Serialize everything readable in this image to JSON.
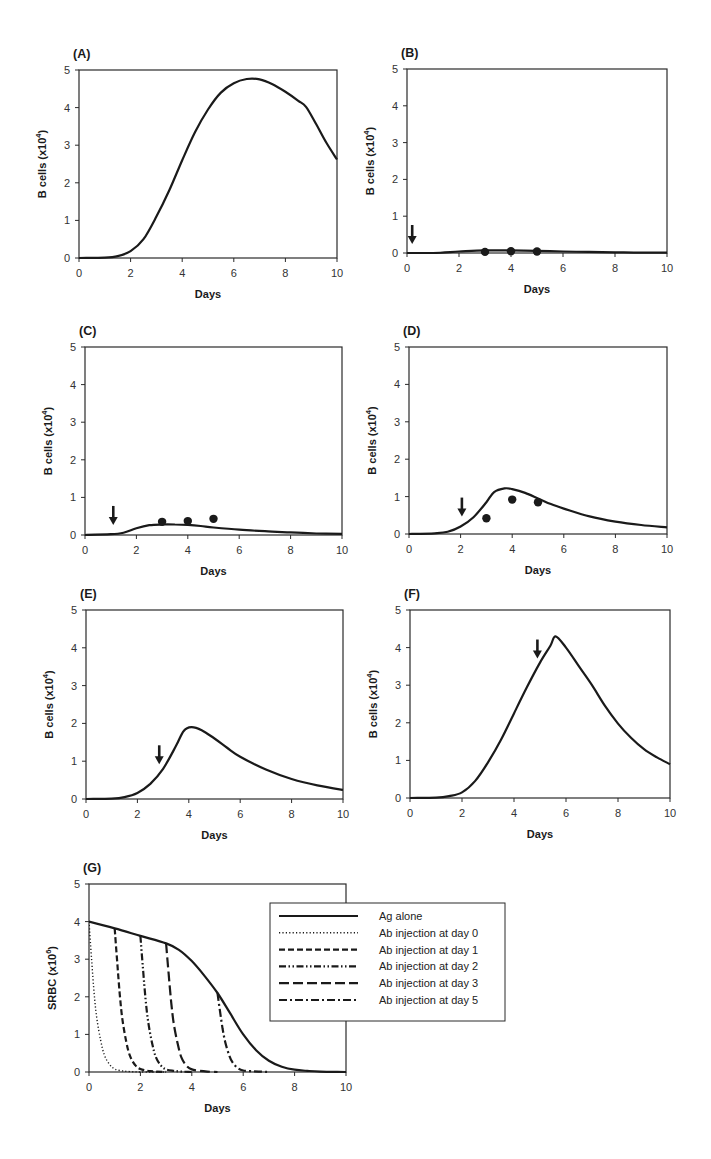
{
  "figure": {
    "width": 711,
    "height": 1159,
    "colors": {
      "ink": "#1a1a1a",
      "axis": "#2a2a2a",
      "background": "#ffffff"
    }
  },
  "chart_data": [
    {
      "id": "A",
      "type": "line",
      "panel_label": "(A)",
      "xlabel": "Days",
      "ylabel": "B cells  (x10",
      "ylabel_sup": "4",
      "ylabel_close": ")",
      "xlim": [
        0,
        10
      ],
      "ylim": [
        0,
        5
      ],
      "xticks": [
        0,
        2,
        4,
        6,
        8,
        10
      ],
      "yticks": [
        0,
        1,
        2,
        3,
        4,
        5
      ],
      "grid": false,
      "arrow_day": null,
      "series": [
        {
          "name": "B cells (model)",
          "style": "solid",
          "x": [
            0,
            1,
            1.5,
            2,
            2.5,
            3,
            3.5,
            4,
            4.5,
            5,
            5.5,
            6,
            6.5,
            7,
            7.5,
            8,
            8.5,
            8.8,
            9.2,
            9.6,
            10
          ],
          "y": [
            0,
            0.01,
            0.05,
            0.18,
            0.5,
            1.1,
            1.8,
            2.6,
            3.35,
            3.95,
            4.4,
            4.65,
            4.76,
            4.75,
            4.62,
            4.42,
            4.18,
            4.02,
            3.55,
            3.05,
            2.62
          ]
        }
      ],
      "points": [],
      "bbox": {
        "left": 79,
        "top": 70,
        "right": 337,
        "bottom": 258
      }
    },
    {
      "id": "B",
      "type": "line",
      "panel_label": "(B)",
      "xlabel": "Days",
      "ylabel": "B cells  (x10",
      "ylabel_sup": "4",
      "ylabel_close": ")",
      "xlim": [
        0,
        10
      ],
      "ylim": [
        0,
        5
      ],
      "xticks": [
        0,
        2,
        4,
        6,
        8,
        10
      ],
      "yticks": [
        0,
        1,
        2,
        3,
        4,
        5
      ],
      "grid": false,
      "arrow_day": 0.2,
      "series": [
        {
          "name": "B cells (model)",
          "style": "solid",
          "x": [
            0,
            1,
            2,
            3,
            4,
            5,
            6,
            7,
            8,
            9,
            10
          ],
          "y": [
            0,
            0,
            0.04,
            0.07,
            0.07,
            0.06,
            0.04,
            0.03,
            0.02,
            0.01,
            0.01
          ]
        }
      ],
      "points": [
        {
          "x": 3,
          "y": 0.03
        },
        {
          "x": 4,
          "y": 0.05
        },
        {
          "x": 5,
          "y": 0.04
        }
      ],
      "bbox": {
        "left": 407,
        "top": 69,
        "right": 667,
        "bottom": 253
      }
    },
    {
      "id": "C",
      "type": "line",
      "panel_label": "(C)",
      "xlabel": "Days",
      "ylabel": "B cells  (x10",
      "ylabel_sup": "4",
      "ylabel_close": ")",
      "xlim": [
        0,
        10
      ],
      "ylim": [
        0,
        5
      ],
      "xticks": [
        0,
        2,
        4,
        6,
        8,
        10
      ],
      "yticks": [
        0,
        1,
        2,
        3,
        4,
        5
      ],
      "grid": false,
      "arrow_day": 1.1,
      "series": [
        {
          "name": "B cells (model)",
          "style": "solid",
          "x": [
            0,
            1,
            1.5,
            2,
            2.5,
            3,
            3.5,
            4,
            4.5,
            5,
            6,
            7,
            8,
            9,
            10
          ],
          "y": [
            0,
            0.02,
            0.06,
            0.18,
            0.26,
            0.28,
            0.28,
            0.27,
            0.24,
            0.2,
            0.14,
            0.1,
            0.07,
            0.04,
            0.03
          ]
        }
      ],
      "points": [
        {
          "x": 3,
          "y": 0.35
        },
        {
          "x": 4,
          "y": 0.37
        },
        {
          "x": 5,
          "y": 0.43
        }
      ],
      "bbox": {
        "left": 85,
        "top": 347,
        "right": 342,
        "bottom": 535
      }
    },
    {
      "id": "D",
      "type": "line",
      "panel_label": "(D)",
      "xlabel": "Days",
      "ylabel": "B cells  (x10",
      "ylabel_sup": "4",
      "ylabel_close": ")",
      "xlim": [
        0,
        10
      ],
      "ylim": [
        0,
        5
      ],
      "xticks": [
        0,
        2,
        4,
        6,
        8,
        10
      ],
      "yticks": [
        0,
        1,
        2,
        3,
        4,
        5
      ],
      "grid": false,
      "arrow_day": 2.05,
      "series": [
        {
          "name": "B cells (model)",
          "style": "solid",
          "x": [
            0,
            1,
            1.5,
            2,
            2.5,
            3,
            3.3,
            3.7,
            4,
            4.5,
            5,
            5.5,
            6,
            7,
            8,
            9,
            10
          ],
          "y": [
            0,
            0.02,
            0.06,
            0.2,
            0.45,
            0.85,
            1.12,
            1.22,
            1.2,
            1.1,
            0.95,
            0.8,
            0.68,
            0.47,
            0.33,
            0.24,
            0.18
          ]
        }
      ],
      "points": [
        {
          "x": 3,
          "y": 0.42
        },
        {
          "x": 4,
          "y": 0.92
        },
        {
          "x": 5,
          "y": 0.85
        }
      ],
      "bbox": {
        "left": 409,
        "top": 347,
        "right": 667,
        "bottom": 534
      }
    },
    {
      "id": "E",
      "type": "line",
      "panel_label": "(E)",
      "xlabel": "Days",
      "ylabel": "B cells  (x10",
      "ylabel_sup": "4",
      "ylabel_close": ")",
      "xlim": [
        0,
        10
      ],
      "ylim": [
        0,
        5
      ],
      "xticks": [
        0,
        2,
        4,
        6,
        8,
        10
      ],
      "yticks": [
        0,
        1,
        2,
        3,
        4,
        5
      ],
      "grid": false,
      "arrow_day": 2.85,
      "series": [
        {
          "name": "B cells (model)",
          "style": "solid",
          "x": [
            0,
            1,
            1.5,
            2,
            2.5,
            3,
            3.5,
            3.8,
            4.1,
            4.5,
            5,
            5.5,
            6,
            7,
            8,
            9,
            10
          ],
          "y": [
            0,
            0.01,
            0.05,
            0.16,
            0.4,
            0.8,
            1.4,
            1.8,
            1.9,
            1.82,
            1.6,
            1.35,
            1.12,
            0.78,
            0.53,
            0.36,
            0.24
          ]
        }
      ],
      "points": [],
      "bbox": {
        "left": 86,
        "top": 610,
        "right": 343,
        "bottom": 799
      }
    },
    {
      "id": "F",
      "type": "line",
      "panel_label": "(F)",
      "xlabel": "Days",
      "ylabel": "B cells  (x10",
      "ylabel_sup": "4",
      "ylabel_close": ")",
      "xlim": [
        0,
        10
      ],
      "ylim": [
        0,
        5
      ],
      "xticks": [
        0,
        2,
        4,
        6,
        8,
        10
      ],
      "yticks": [
        0,
        1,
        2,
        3,
        4,
        5
      ],
      "grid": false,
      "arrow_day": 4.9,
      "series": [
        {
          "name": "B cells (model)",
          "style": "solid",
          "x": [
            0,
            1,
            1.5,
            2,
            2.5,
            3,
            3.5,
            4,
            4.5,
            5,
            5.4,
            5.6,
            6,
            6.5,
            7,
            7.5,
            8,
            8.5,
            9,
            9.5,
            10
          ],
          "y": [
            0,
            0.01,
            0.05,
            0.15,
            0.45,
            0.95,
            1.55,
            2.25,
            2.95,
            3.6,
            4.05,
            4.3,
            4.0,
            3.5,
            3.0,
            2.45,
            1.98,
            1.6,
            1.3,
            1.08,
            0.9
          ]
        }
      ],
      "points": [],
      "bbox": {
        "left": 410,
        "top": 610,
        "right": 670,
        "bottom": 798
      }
    },
    {
      "id": "G",
      "type": "line",
      "panel_label": "(G)",
      "xlabel": "Days",
      "ylabel": "SRBC  (x10",
      "ylabel_sup": "6",
      "ylabel_close": ")",
      "xlim": [
        0,
        10
      ],
      "ylim": [
        0,
        5
      ],
      "xticks": [
        0,
        2,
        4,
        6,
        8,
        10
      ],
      "yticks": [
        0,
        1,
        2,
        3,
        4,
        5
      ],
      "grid": false,
      "arrow_day": null,
      "series": [
        {
          "name": "Ag alone",
          "style": "solid",
          "x": [
            0,
            1,
            2,
            3,
            3.5,
            4,
            4.5,
            5,
            5.5,
            6,
            6.5,
            7,
            7.5,
            8,
            8.5,
            9,
            10
          ],
          "y": [
            4.0,
            3.82,
            3.62,
            3.42,
            3.25,
            2.95,
            2.55,
            2.1,
            1.55,
            1.0,
            0.58,
            0.3,
            0.14,
            0.06,
            0.03,
            0.01,
            0
          ]
        },
        {
          "name": "Ab injection at day 0",
          "style": "dotted",
          "x": [
            0,
            0.1,
            0.2,
            0.3,
            0.45,
            0.6,
            0.8,
            1.0,
            1.3,
            1.6,
            2,
            3
          ],
          "y": [
            4.0,
            3.0,
            2.1,
            1.45,
            0.85,
            0.45,
            0.2,
            0.08,
            0.03,
            0.01,
            0,
            0
          ]
        },
        {
          "name": "Ab injection at day 1",
          "style": "dashed",
          "x": [
            1,
            1.1,
            1.2,
            1.3,
            1.45,
            1.6,
            1.8,
            2.0,
            2.3,
            2.6,
            3
          ],
          "y": [
            3.82,
            2.9,
            2.05,
            1.4,
            0.8,
            0.42,
            0.18,
            0.08,
            0.03,
            0.01,
            0
          ]
        },
        {
          "name": "Ab injection at day 2",
          "style": "dash-dot-dot",
          "x": [
            2,
            2.1,
            2.2,
            2.3,
            2.45,
            2.6,
            2.8,
            3.0,
            3.3,
            3.6,
            4
          ],
          "y": [
            3.62,
            2.75,
            1.95,
            1.35,
            0.78,
            0.4,
            0.17,
            0.07,
            0.03,
            0.01,
            0
          ]
        },
        {
          "name": "Ab injection at day 3",
          "style": "long-dash",
          "x": [
            3,
            3.1,
            3.2,
            3.3,
            3.45,
            3.6,
            3.8,
            4.0,
            4.3,
            4.6,
            5
          ],
          "y": [
            3.42,
            2.6,
            1.85,
            1.28,
            0.75,
            0.38,
            0.16,
            0.07,
            0.03,
            0.01,
            0
          ]
        },
        {
          "name": "Ab injection at day 5",
          "style": "dash-dot",
          "x": [
            5,
            5.1,
            5.2,
            5.3,
            5.45,
            5.6,
            5.8,
            6.0,
            6.3,
            6.6,
            7
          ],
          "y": [
            2.1,
            1.6,
            1.15,
            0.8,
            0.45,
            0.24,
            0.1,
            0.04,
            0.02,
            0.01,
            0
          ]
        }
      ],
      "points": [],
      "legend": {
        "position": "right-overlapping",
        "entries": [
          {
            "label": "Ag alone",
            "style": "solid"
          },
          {
            "label": "Ab injection at day 0",
            "style": "dotted"
          },
          {
            "label": "Ab injection at day 1",
            "style": "dashed"
          },
          {
            "label": "Ab injection at day 2",
            "style": "dash-dot-dot"
          },
          {
            "label": "Ab injection at day 3",
            "style": "long-dash"
          },
          {
            "label": "Ab injection at day 5",
            "style": "dash-dot"
          }
        ],
        "box": {
          "left": 270,
          "top": 903,
          "right": 505,
          "bottom": 1021
        }
      },
      "bbox": {
        "left": 89,
        "top": 884,
        "right": 346,
        "bottom": 1072
      }
    }
  ]
}
